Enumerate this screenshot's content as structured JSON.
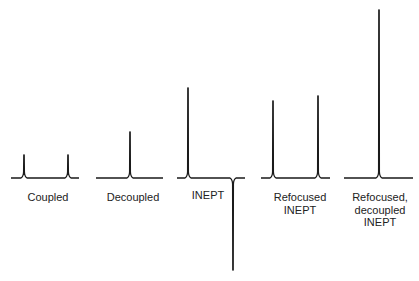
{
  "colors": {
    "trace": "#1a1a1a",
    "text": "#222222",
    "background": "#ffffff"
  },
  "spectra": [
    {
      "id": "coupled",
      "label_lines": [
        "Coupled"
      ],
      "label_x": 48,
      "label_y": 191,
      "baseline": [
        11,
        79
      ],
      "peaks": [
        {
          "x": 24,
          "top": 155
        },
        {
          "x": 68,
          "top": 155
        }
      ]
    },
    {
      "id": "decoupled",
      "label_lines": [
        "Decoupled"
      ],
      "label_x": 133,
      "label_y": 191,
      "baseline": [
        96,
        163
      ],
      "peaks": [
        {
          "x": 130,
          "top": 132
        }
      ]
    },
    {
      "id": "inept",
      "label_lines": [
        "INEPT"
      ],
      "label_x": 208,
      "label_y": 189,
      "baseline": [
        177,
        245
      ],
      "peaks": [
        {
          "x": 188,
          "top": 88
        },
        {
          "x": 233,
          "top": 270
        }
      ]
    },
    {
      "id": "refocused-inept",
      "label_lines": [
        "Refocused",
        "INEPT"
      ],
      "label_x": 300,
      "label_y": 191,
      "baseline": [
        261,
        330
      ],
      "peaks": [
        {
          "x": 273,
          "top": 101
        },
        {
          "x": 318,
          "top": 96
        }
      ]
    },
    {
      "id": "refocused-decoupled-inept",
      "label_lines": [
        "Refocused,",
        "decoupled",
        "INEPT"
      ],
      "label_x": 380,
      "label_y": 191,
      "baseline": [
        344,
        413
      ],
      "peaks": [
        {
          "x": 379,
          "top": 10
        }
      ]
    }
  ],
  "baseline_y": 178
}
